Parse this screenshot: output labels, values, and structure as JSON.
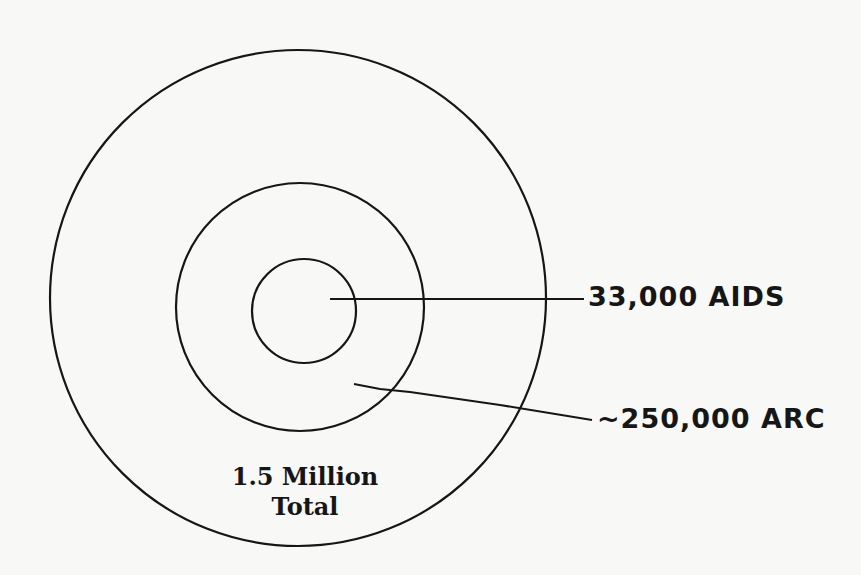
{
  "diagram": {
    "type": "concentric-circles",
    "colors": {
      "background": "#f8f8f6",
      "stroke": "#161616"
    },
    "circles": [
      {
        "id": "total",
        "cx": 298,
        "cy": 298,
        "r": 248
      },
      {
        "id": "arc",
        "cx": 300,
        "cy": 307,
        "r": 124
      },
      {
        "id": "aids",
        "cx": 304,
        "cy": 311,
        "r": 52
      }
    ],
    "labels": {
      "aids": "33,000 AIDS",
      "arc": "~250,000 ARC",
      "total_line1": "1.5 Million",
      "total_line2": "Total"
    }
  }
}
